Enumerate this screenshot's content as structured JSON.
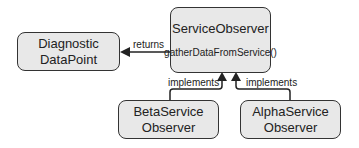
{
  "nodes": {
    "service_observer": {
      "title": "ServiceObserver",
      "method": "gatherDataFromService()"
    },
    "diagnostic_datapoint": {
      "line1": "Diagnostic",
      "line2": "DataPoint"
    },
    "beta_observer": {
      "line1": "BetaService",
      "line2": "Observer"
    },
    "alpha_observer": {
      "line1": "AlphaService",
      "line2": "Observer"
    }
  },
  "edges": {
    "returns": {
      "label": "returns"
    },
    "beta_implements": {
      "label": "implements"
    },
    "alpha_implements": {
      "label": "implements"
    }
  },
  "colors": {
    "box_fill": "#e8e8e8",
    "stroke": "#333333"
  }
}
